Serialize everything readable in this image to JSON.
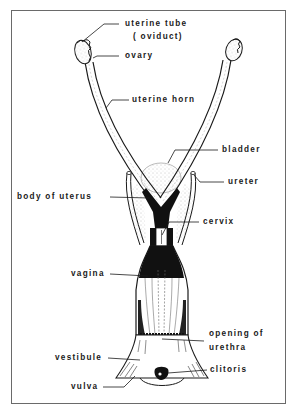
{
  "diagram": {
    "colors": {
      "ink": "#1a1a1a",
      "frame": "#6a6a6a",
      "background": "#ffffff",
      "stipple": "#bdbdbd"
    },
    "labels": {
      "uterine_tube_line1": "uterine tube",
      "uterine_tube_line2": "( oviduct)",
      "ovary": "ovary",
      "uterine_horn": "uterine horn",
      "bladder": "bladder",
      "ureter": "ureter",
      "body_of_uterus": "body of uterus",
      "cervix": "cervix",
      "vagina": "vagina",
      "opening_of_urethra_line1": "opening of",
      "opening_of_urethra_line2": "urethra",
      "vestibule": "vestibule",
      "clitoris": "clitoris",
      "vulva": "vulva"
    }
  }
}
